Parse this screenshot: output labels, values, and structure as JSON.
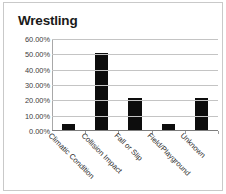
{
  "chart_data": {
    "type": "bar",
    "title": "Wrestling",
    "xlabel": "",
    "ylabel": "",
    "categories": [
      "Climatic Condition",
      "Collision Impact",
      "Fall or Slip",
      "Field/Playground",
      "Unknown"
    ],
    "values": [
      4.17,
      50.0,
      20.83,
      4.17,
      20.83
    ],
    "value_labels": [
      "4.17%",
      "50.00%",
      "20.83%",
      "4.17%",
      "20.83%"
    ],
    "ylim": [
      0,
      60
    ],
    "ytick_values": [
      0,
      10,
      20,
      30,
      40,
      50,
      60
    ],
    "ytick_labels": [
      "0.00%",
      "10.00%",
      "20.00%",
      "30.00%",
      "40.00%",
      "50.00%",
      "60.00%"
    ],
    "grid": true,
    "legend": false,
    "legend_position": "none",
    "bar_color": "#0d0d0d",
    "gridline_color": "#c4c4c4",
    "axis_color": "#7d7d7d",
    "title_color": "#1a1a1a",
    "tick_label_color": "#3d3d3d",
    "background_color": "#ffffff",
    "frame_color": "#c9c9c9"
  }
}
